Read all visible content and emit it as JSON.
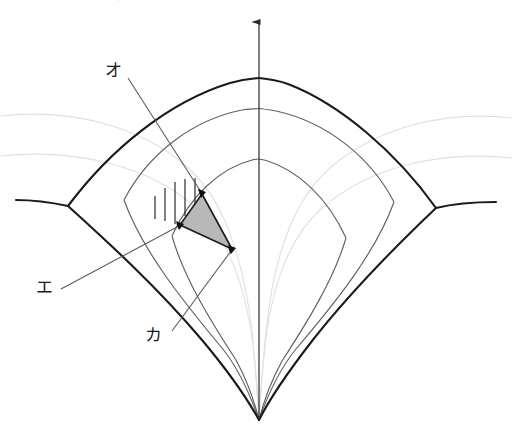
{
  "page": {
    "width": 512,
    "height": 441,
    "background": "#ffffff",
    "top_clipped_text": "点を含む鉛直面内で，円弧中心を結ぶ直線に対する角度を"
  },
  "figure": {
    "type": "geometry-diagram",
    "colors": {
      "outer_curve": "#1a1a1a",
      "inner_curve_mid": "#555555",
      "inner_curve_faint": "#d8d8d8",
      "axis": "#2b2b2b",
      "leader_line": "#555555",
      "triangle_fill": "#b3b3b3",
      "triangle_stroke": "#1a1a1a",
      "hatch": "#2b2b2b",
      "label_text": "#1a1a1a"
    },
    "axis": {
      "name": "vertical-axis",
      "x": 259,
      "top_y": 15,
      "bottom_y": 420,
      "arrowhead": "up"
    },
    "cusp_point": {
      "x": 259,
      "y": 420
    },
    "junctions": [
      {
        "name": "left-junction",
        "x": 68,
        "y": 206
      },
      {
        "name": "right-junction",
        "x": 436,
        "y": 208
      }
    ],
    "triangle": {
      "name": "shaded-triangle",
      "vertices": [
        {
          "label": "top",
          "x": 202,
          "y": 194
        },
        {
          "label": "left",
          "x": 180,
          "y": 225
        },
        {
          "label": "bottom-right",
          "x": 232,
          "y": 249
        }
      ]
    },
    "hatching": {
      "name": "vertical-hatching",
      "count": 5,
      "lines": [
        {
          "x": 155,
          "y1": 196,
          "y2": 219
        },
        {
          "x": 165,
          "y1": 188,
          "y2": 221
        },
        {
          "x": 175,
          "y1": 182,
          "y2": 224
        },
        {
          "x": 185,
          "y1": 179,
          "y2": 215
        },
        {
          "x": 195,
          "y1": 178,
          "y2": 203
        }
      ]
    },
    "labels": [
      {
        "id": "o",
        "text": "オ",
        "x": 105,
        "y": 62,
        "leader": {
          "x1": 128,
          "y1": 78,
          "x2": 202,
          "y2": 193
        }
      },
      {
        "id": "e",
        "text": "エ",
        "x": 36,
        "y": 279,
        "leader": {
          "x1": 61,
          "y1": 289,
          "x2": 180,
          "y2": 226
        }
      },
      {
        "id": "ka",
        "text": "カ",
        "x": 145,
        "y": 327,
        "leader": {
          "x1": 172,
          "y1": 331,
          "x2": 231,
          "y2": 250
        }
      }
    ]
  }
}
